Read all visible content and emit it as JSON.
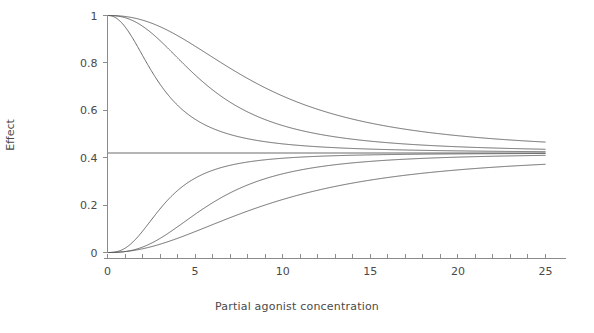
{
  "chart_data": {
    "type": "line",
    "title": "",
    "xlabel": "Partial agonist concentration",
    "ylabel": "Effect",
    "xlim": [
      0,
      25
    ],
    "ylim": [
      0,
      1
    ],
    "grid": false,
    "legend": "none",
    "xticks": [
      0,
      5,
      10,
      15,
      20,
      25
    ],
    "xtick_labels": [
      "0",
      "5",
      "10",
      "15",
      "20",
      "25"
    ],
    "xminor_tick_step": 1,
    "yticks": [
      0,
      0.2,
      0.4,
      0.6,
      0.8,
      1
    ],
    "ytick_labels": [
      "0",
      "0.2",
      "0.4",
      "0.6",
      "0.8",
      "1"
    ],
    "line_color": "#5a5a5a",
    "plateau_value": 0.42,
    "x": [
      0,
      0.5,
      1,
      1.5,
      2,
      2.5,
      3,
      3.5,
      4,
      4.5,
      5,
      5.5,
      6,
      6.5,
      7,
      7.5,
      8,
      8.5,
      9,
      9.5,
      10,
      11,
      12,
      13,
      14,
      15,
      16,
      17,
      18,
      19,
      20,
      21,
      22,
      23,
      24,
      25
    ],
    "series": [
      {
        "name": "descending-fast",
        "direction": "decreasing",
        "start": 1.0,
        "end": 0.42,
        "ec50": 3.0,
        "hill": 2.2,
        "values": [
          1.0,
          0.996,
          0.981,
          0.952,
          0.907,
          0.849,
          0.79,
          0.731,
          0.676,
          0.63,
          0.59,
          0.558,
          0.532,
          0.511,
          0.494,
          0.48,
          0.47,
          0.462,
          0.456,
          0.451,
          0.447,
          0.441,
          0.437,
          0.434,
          0.432,
          0.43,
          0.429,
          0.428,
          0.427,
          0.426,
          0.425,
          0.425,
          0.424,
          0.424,
          0.423,
          0.423
        ]
      },
      {
        "name": "descending-mid",
        "direction": "decreasing",
        "start": 1.0,
        "end": 0.42,
        "ec50": 5.6,
        "hill": 2.4,
        "values": [
          1.0,
          1.0,
          0.997,
          0.99,
          0.978,
          0.958,
          0.93,
          0.895,
          0.854,
          0.808,
          0.76,
          0.713,
          0.669,
          0.629,
          0.594,
          0.563,
          0.537,
          0.516,
          0.498,
          0.484,
          0.472,
          0.456,
          0.446,
          0.44,
          0.436,
          0.433,
          0.431,
          0.43,
          0.428,
          0.427,
          0.427,
          0.426,
          0.425,
          0.425,
          0.424,
          0.424
        ]
      },
      {
        "name": "descending-slow",
        "direction": "decreasing",
        "start": 1.0,
        "end": 0.42,
        "ec50": 8.6,
        "hill": 2.3,
        "values": [
          1.0,
          1.0,
          0.999,
          0.998,
          0.995,
          0.991,
          0.984,
          0.974,
          0.961,
          0.944,
          0.923,
          0.898,
          0.87,
          0.839,
          0.806,
          0.772,
          0.739,
          0.706,
          0.675,
          0.646,
          0.62,
          0.573,
          0.537,
          0.51,
          0.49,
          0.476,
          0.465,
          0.457,
          0.451,
          0.447,
          0.443,
          0.44,
          0.438,
          0.436,
          0.435,
          0.433
        ]
      },
      {
        "name": "plateau",
        "direction": "constant",
        "start": 0.42,
        "end": 0.42,
        "values": [
          0.42,
          0.42,
          0.42,
          0.42,
          0.42,
          0.42,
          0.42,
          0.42,
          0.42,
          0.42,
          0.42,
          0.42,
          0.42,
          0.42,
          0.42,
          0.42,
          0.42,
          0.42,
          0.42,
          0.42,
          0.42,
          0.42,
          0.42,
          0.42,
          0.42,
          0.42,
          0.42,
          0.42,
          0.42,
          0.42,
          0.42,
          0.42,
          0.42,
          0.42,
          0.42,
          0.42
        ]
      },
      {
        "name": "ascending-fast",
        "direction": "increasing",
        "start": 0.0,
        "end": 0.42,
        "ec50": 3.3,
        "hill": 2.6,
        "values": [
          0.0,
          0.003,
          0.017,
          0.045,
          0.086,
          0.135,
          0.185,
          0.232,
          0.272,
          0.305,
          0.331,
          0.352,
          0.367,
          0.379,
          0.388,
          0.394,
          0.399,
          0.403,
          0.406,
          0.408,
          0.41,
          0.413,
          0.414,
          0.416,
          0.416,
          0.417,
          0.417,
          0.418,
          0.418,
          0.418,
          0.419,
          0.419,
          0.419,
          0.419,
          0.419,
          0.419
        ]
      },
      {
        "name": "ascending-mid",
        "direction": "increasing",
        "start": 0.0,
        "end": 0.42,
        "ec50": 6.0,
        "hill": 2.6,
        "values": [
          0.0,
          0.001,
          0.004,
          0.012,
          0.025,
          0.045,
          0.071,
          0.102,
          0.136,
          0.171,
          0.205,
          0.236,
          0.263,
          0.288,
          0.308,
          0.324,
          0.338,
          0.349,
          0.358,
          0.365,
          0.372,
          0.381,
          0.388,
          0.393,
          0.397,
          0.4,
          0.403,
          0.405,
          0.406,
          0.407,
          0.409,
          0.41,
          0.41,
          0.411,
          0.412,
          0.412
        ]
      },
      {
        "name": "ascending-slow",
        "direction": "increasing",
        "start": 0.0,
        "end": 0.42,
        "ec50": 9.4,
        "hill": 2.1,
        "values": [
          0.0,
          0.0,
          0.002,
          0.005,
          0.011,
          0.019,
          0.03,
          0.045,
          0.062,
          0.082,
          0.104,
          0.126,
          0.149,
          0.171,
          0.193,
          0.213,
          0.232,
          0.25,
          0.266,
          0.28,
          0.293,
          0.315,
          0.333,
          0.347,
          0.358,
          0.367,
          0.374,
          0.38,
          0.385,
          0.389,
          0.392,
          0.395,
          0.398,
          0.4,
          0.402,
          0.403
        ]
      }
    ],
    "annotations": []
  }
}
